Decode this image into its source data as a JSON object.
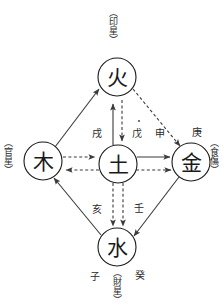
{
  "diagram": {
    "nodes": [
      {
        "id": "fire",
        "label": "火",
        "cx": 117,
        "cy": 77,
        "r": 19
      },
      {
        "id": "wood",
        "label": "木",
        "cx": 43,
        "cy": 161,
        "r": 19
      },
      {
        "id": "earth",
        "label": "土",
        "cx": 118,
        "cy": 164,
        "r": 19
      },
      {
        "id": "metal",
        "label": "金",
        "cx": 191,
        "cy": 162,
        "r": 19
      },
      {
        "id": "water",
        "label": "水",
        "cx": 117,
        "cy": 247,
        "r": 19
      }
    ],
    "outer_labels": [
      {
        "id": "top",
        "text": "（印星）",
        "x": 112,
        "y": 10
      },
      {
        "id": "left",
        "text": "（官星）",
        "x": 2,
        "y": 140
      },
      {
        "id": "right",
        "text": "（食傷）",
        "x": 212,
        "y": 140
      },
      {
        "id": "bottom",
        "text": "（財星）",
        "x": 112,
        "y": 272
      }
    ],
    "stem_labels": [
      {
        "id": "xu",
        "text": "戌",
        "x": 97,
        "y": 133
      },
      {
        "id": "wu",
        "text": "戊",
        "x": 137,
        "y": 133
      },
      {
        "id": "shen",
        "text": "申",
        "x": 158,
        "y": 133
      },
      {
        "id": "geng",
        "text": "庚",
        "x": 197,
        "y": 132
      },
      {
        "id": "hai",
        "text": "亥",
        "x": 97,
        "y": 209
      },
      {
        "id": "ren",
        "text": "壬",
        "x": 138,
        "y": 208
      },
      {
        "id": "zi",
        "text": "子",
        "x": 95,
        "y": 275
      },
      {
        "id": "gui",
        "text": "癸",
        "x": 140,
        "y": 274
      }
    ],
    "edges": [
      {
        "id": "wood-to-fire",
        "style": "solid",
        "from": "wood",
        "to": "fire"
      },
      {
        "id": "fire-to-metal",
        "style": "dashed",
        "from": "fire",
        "to": "metal"
      },
      {
        "id": "metal-to-water",
        "style": "solid",
        "from": "metal",
        "to": "water"
      },
      {
        "id": "water-to-wood",
        "style": "solid",
        "from": "water",
        "to": "wood"
      },
      {
        "id": "earth-to-fire",
        "style": "solid",
        "from": "earth",
        "to": "fire"
      },
      {
        "id": "fire-to-earth",
        "style": "dashed",
        "from": "fire",
        "to": "earth"
      },
      {
        "id": "wood-to-earth",
        "style": "dashed",
        "from": "wood",
        "to": "earth"
      },
      {
        "id": "earth-to-wood",
        "style": "dashed",
        "from": "earth",
        "to": "wood"
      },
      {
        "id": "earth-to-metal-solid",
        "style": "solid",
        "from": "earth",
        "to": "metal"
      },
      {
        "id": "earth-to-metal-dashed",
        "style": "dashed",
        "from": "earth",
        "to": "metal"
      },
      {
        "id": "earth-to-water-a",
        "style": "dashed",
        "from": "earth",
        "to": "water"
      },
      {
        "id": "earth-to-water-b",
        "style": "dashed",
        "from": "earth",
        "to": "water"
      }
    ],
    "colors": {
      "stroke": "#3a3a3a",
      "node_stroke": "#1a1a1a",
      "text": "#1a1a1a",
      "background": "#ffffff"
    }
  }
}
